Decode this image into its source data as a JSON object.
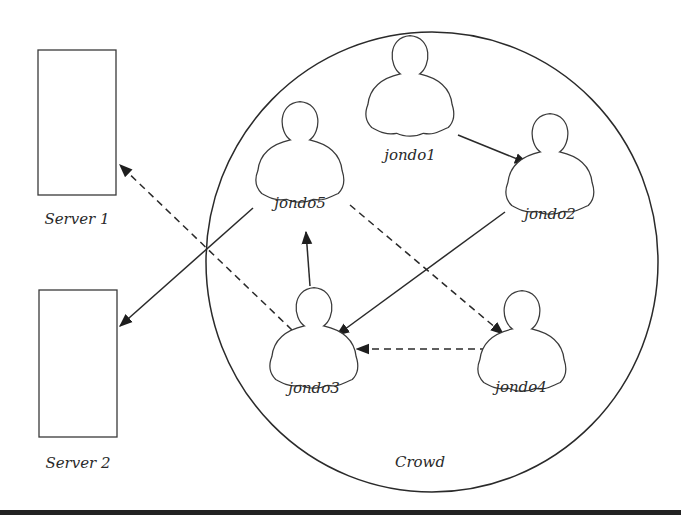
{
  "diagram": {
    "type": "network-diagram",
    "servers": [
      {
        "id": "server1",
        "label": "Server 1"
      },
      {
        "id": "server2",
        "label": "Server 2"
      }
    ],
    "crowd": {
      "label": "Crowd"
    },
    "nodes": [
      {
        "id": "jondo1",
        "label": "jondo1"
      },
      {
        "id": "jondo2",
        "label": "jondo2"
      },
      {
        "id": "jondo3",
        "label": "jondo3"
      },
      {
        "id": "jondo4",
        "label": "jondo4"
      },
      {
        "id": "jondo5",
        "label": "jondo5"
      }
    ],
    "edges": [
      {
        "from": "jondo1",
        "to": "jondo2",
        "style": "solid"
      },
      {
        "from": "jondo2",
        "to": "jondo3",
        "style": "solid"
      },
      {
        "from": "jondo3",
        "to": "jondo5",
        "style": "solid"
      },
      {
        "from": "jondo5",
        "to": "server2",
        "style": "solid"
      },
      {
        "from": "jondo5",
        "to": "jondo4",
        "style": "dashed"
      },
      {
        "from": "jondo4",
        "to": "jondo3",
        "style": "dashed"
      },
      {
        "from": "jondo3",
        "to": "server1",
        "style": "dashed"
      }
    ]
  }
}
